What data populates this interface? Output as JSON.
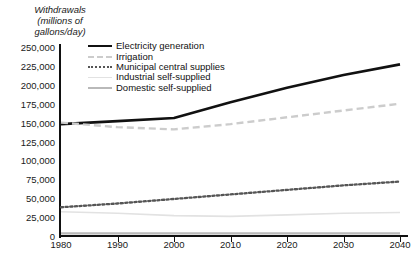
{
  "axis_title": "Withdrawals\n(millions of\ngallons/day)",
  "legend": {
    "position": "top-left-inside",
    "items": [
      {
        "label": "Electricity generation",
        "icon": "line-solid-thick-black-icon",
        "color": "#111111",
        "style": "solid"
      },
      {
        "label": "Irrigation",
        "icon": "line-dashed-lightgray-icon",
        "color": "#cccccc",
        "style": "dashed"
      },
      {
        "label": "Municipal central supplies",
        "icon": "line-dotted-darkgray-icon",
        "color": "#555555",
        "style": "dotted"
      },
      {
        "label": "Industrial self-supplied",
        "icon": "line-solid-thin-verylightgray-icon",
        "color": "#e2e2e2",
        "style": "solid"
      },
      {
        "label": "Domestic self-supplied",
        "icon": "line-solid-gray-icon",
        "color": "#b9b9b9",
        "style": "solid"
      }
    ]
  },
  "caption_remnant": "",
  "chart_data": {
    "type": "line",
    "title": "",
    "subtitle": "",
    "xlabel": "",
    "ylabel": "Withdrawals (millions of gallons/day)",
    "xlim": [
      1980,
      2040
    ],
    "ylim": [
      0,
      250000
    ],
    "grid": false,
    "legend_position": "top-left-inside",
    "x_ticks": [
      1980,
      1990,
      2000,
      2010,
      2020,
      2030,
      2040
    ],
    "x_tick_labels": [
      "1980",
      "1990",
      "2000",
      "2010",
      "2020",
      "2030",
      "2040"
    ],
    "y_ticks": [
      0,
      25000,
      50000,
      75000,
      100000,
      125000,
      150000,
      175000,
      200000,
      225000,
      250000
    ],
    "y_tick_labels": [
      "0",
      "25,000",
      "50,000",
      "75,000",
      "100,000",
      "125,000",
      "150,000",
      "175,000",
      "200,000",
      "225,000",
      "250,000"
    ],
    "x": [
      1980,
      1990,
      2000,
      2010,
      2020,
      2030,
      2040
    ],
    "series": [
      {
        "name": "Electricity generation",
        "color": "#111111",
        "style": "solid",
        "width": 2.6,
        "values": [
          148000,
          152000,
          156000,
          177000,
          196000,
          213000,
          227000
        ]
      },
      {
        "name": "Irrigation",
        "color": "#cccccc",
        "style": "dashed",
        "width": 2.4,
        "values": [
          150000,
          144000,
          141000,
          148000,
          157000,
          166000,
          175000
        ]
      },
      {
        "name": "Municipal central supplies",
        "color": "#555555",
        "style": "dotted",
        "width": 2.3,
        "values": [
          38000,
          43000,
          49000,
          55000,
          61000,
          67000,
          72000
        ]
      },
      {
        "name": "Industrial self-supplied",
        "color": "#e2e2e2",
        "style": "solid",
        "width": 1.6,
        "values": [
          32000,
          30000,
          27000,
          26000,
          28000,
          30000,
          31000
        ]
      },
      {
        "name": "Domestic self-supplied",
        "color": "#b9b9b9",
        "style": "solid",
        "width": 2.2,
        "values": [
          3500,
          3500,
          3500,
          3500,
          3500,
          3500,
          3500
        ]
      }
    ]
  }
}
